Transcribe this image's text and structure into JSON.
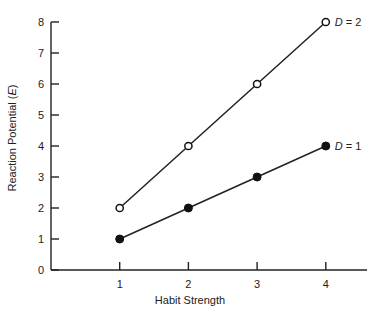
{
  "chart_data": {
    "type": "line",
    "title": "",
    "xlabel": "Habit Strength",
    "ylabel": "Reaction Potential (E)",
    "ylabel_parts": {
      "prefix": "Reaction Potential (",
      "italic": "E",
      "suffix": ")"
    },
    "x": [
      1,
      2,
      3,
      4
    ],
    "x_ticks": [
      "1",
      "2",
      "3",
      "4"
    ],
    "y_ticks": [
      "0",
      "1",
      "2",
      "3",
      "4",
      "5",
      "6",
      "7",
      "8"
    ],
    "xlim": [
      0,
      4.6
    ],
    "ylim": [
      0,
      8
    ],
    "grid": false,
    "legend_position": "inline-end-of-line",
    "series": [
      {
        "name": "D = 2",
        "label_italic": "D",
        "label_rest": " = 2",
        "marker": "open-circle",
        "values": [
          2,
          4,
          6,
          8
        ]
      },
      {
        "name": "D = 1",
        "label_italic": "D",
        "label_rest": " = 1",
        "marker": "filled-circle",
        "values": [
          1,
          2,
          3,
          4
        ]
      }
    ]
  }
}
